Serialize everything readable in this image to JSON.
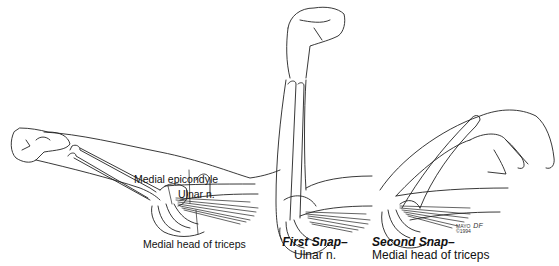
{
  "figure": {
    "panels": [
      {
        "name": "extended-arm",
        "labels": [
          "Medial epicondyle",
          "Ulnar n.",
          "Medial head of triceps"
        ]
      },
      {
        "name": "first-snap",
        "caption_title": "First Snap–",
        "caption_sub": "Ulnar n."
      },
      {
        "name": "second-snap",
        "caption_title": "Second Snap–",
        "caption_sub": "Medial head of triceps"
      }
    ],
    "signature": {
      "text": "MAYO",
      "initials": "DF",
      "date": "©1994"
    },
    "colors": {
      "line": "#222222",
      "background": "#ffffff"
    }
  }
}
